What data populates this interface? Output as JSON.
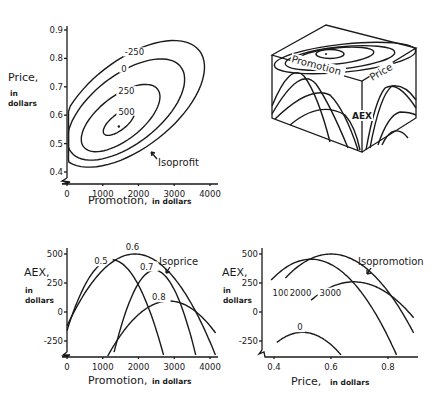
{
  "chart_data": [
    {
      "id": "isoprofit",
      "type": "contour",
      "title": "",
      "xlabel": "Promotion,",
      "xlabel_unit": "in dollars",
      "ylabel": "Price,",
      "ylabel_unit": [
        "in",
        "dollars"
      ],
      "xlim": [
        0,
        4200
      ],
      "ylim": [
        0.38,
        0.92
      ],
      "xticks": [
        0,
        1000,
        2000,
        3000,
        4000
      ],
      "xtick_labels": [
        "0",
        "1000",
        "2000",
        "3000",
        "4000"
      ],
      "yticks": [
        0.4,
        0.5,
        0.6,
        0.7,
        0.8,
        0.9
      ],
      "ytick_labels": [
        "0.4",
        "0.5",
        "0.6",
        "0.7",
        "0.8",
        "0.9"
      ],
      "optimum": {
        "promotion": 1450,
        "price": 0.56
      },
      "contours": [
        {
          "level": 500,
          "label": "500",
          "center": [
            1450,
            0.575
          ],
          "rx": 500,
          "ry": 0.05
        },
        {
          "level": 250,
          "label": "250",
          "center": [
            1500,
            0.59
          ],
          "rx": 1250,
          "ry": 0.14
        },
        {
          "level": 0,
          "label": "0",
          "center": [
            1650,
            0.62
          ],
          "rx": 1850,
          "ry": 0.22
        },
        {
          "level": -250,
          "label": "-250",
          "center": [
            1800,
            0.64
          ],
          "rx": 2300,
          "ry": 0.28
        }
      ],
      "annotation": "Isoprofit"
    },
    {
      "id": "isoprice",
      "type": "line",
      "xlabel": "Promotion,",
      "xlabel_unit": "in dollars",
      "ylabel": "AEX,",
      "ylabel_unit": [
        "in",
        "dollars"
      ],
      "xlim": [
        0,
        4200
      ],
      "ylim": [
        -370,
        520
      ],
      "xticks": [
        0,
        1000,
        2000,
        3000,
        4000
      ],
      "xtick_labels": [
        "0",
        "1000",
        "2000",
        "3000",
        "4000"
      ],
      "yticks": [
        -250,
        0,
        250,
        500
      ],
      "ytick_labels": [
        "-250",
        "0",
        "250",
        "500"
      ],
      "series": [
        {
          "name": "0.5",
          "peak_x": 1250,
          "peak_y": 450,
          "x_start": 0,
          "x_end": 2700,
          "y_end": -370
        },
        {
          "name": "0.6",
          "peak_x": 1900,
          "peak_y": 500,
          "x_start": 0,
          "x_end": 4150,
          "y_end": -370
        },
        {
          "name": "0.7",
          "peak_x": 2450,
          "peak_y": 360,
          "x_start": 220,
          "x_end": 3600,
          "y_end": -370
        },
        {
          "name": "0.8",
          "peak_x": 2850,
          "peak_y": 95,
          "x_start": 750,
          "x_end": 4200,
          "y_end": -200
        }
      ],
      "annotation": "Isoprice"
    },
    {
      "id": "isopromotion",
      "type": "line",
      "xlabel": "Price,",
      "xlabel_unit": "in dollars",
      "ylabel": "AEX,",
      "ylabel_unit": [
        "in",
        "dollars"
      ],
      "xlim": [
        0.36,
        0.9
      ],
      "ylim": [
        -370,
        520
      ],
      "xticks": [
        0.4,
        0.6,
        0.8
      ],
      "xtick_labels": [
        "0.4",
        "0.6",
        "0.8"
      ],
      "yticks": [
        -250,
        0,
        250,
        500
      ],
      "ytick_labels": [
        "-250",
        "0",
        "250",
        "500"
      ],
      "series": [
        {
          "name": "0",
          "peak_x": 0.5,
          "peak_y": -175,
          "x_start": 0.41,
          "x_end": 0.635
        },
        {
          "name": "1000",
          "peak_x": 0.53,
          "peak_y": 455,
          "x_start": 0.39,
          "x_end": 0.83
        },
        {
          "name": "2000",
          "peak_x": 0.6,
          "peak_y": 500,
          "x_start": 0.44,
          "x_end": 0.89,
          "y_end": -180
        },
        {
          "name": "3000",
          "peak_x": 0.68,
          "peak_y": 260,
          "x_start": 0.53,
          "x_end": 0.89,
          "y_end": -50
        }
      ],
      "annotation": "Isopromotion"
    }
  ],
  "diagram3d": {
    "labels": {
      "promotion": "Promotion",
      "price": "Price",
      "aex": "AEX"
    }
  }
}
